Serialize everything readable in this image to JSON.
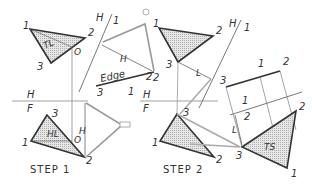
{
  "figure": {
    "step1": {
      "caption": "STEP 1",
      "top_view": {
        "vertices": [
          "1",
          "2",
          "3"
        ],
        "line_label": "TL",
        "point": "O"
      },
      "front_view": {
        "vertices": [
          "1",
          "2",
          "3"
        ],
        "line_label": "HL",
        "point": "O"
      },
      "fold_line": {
        "upper": "H",
        "lower": "F"
      },
      "aux_fold": {
        "left": "H",
        "right": "1"
      },
      "dimension": "H",
      "edge_view": {
        "label": "Edge",
        "points": [
          "3",
          "1",
          "2"
        ]
      }
    },
    "step2": {
      "caption": "STEP 2",
      "top_view": {
        "vertices": [
          "1",
          "2",
          "3"
        ]
      },
      "front_view": {
        "vertices": [
          "1",
          "2",
          "3"
        ]
      },
      "fold_line": {
        "upper": "H",
        "lower": "F"
      },
      "aux_fold": {
        "left": "H",
        "right": "1"
      },
      "dimension": "L",
      "edge_view": {
        "points": [
          "3",
          "1",
          "2"
        ]
      },
      "aux_fold2": {
        "upper": "1",
        "lower": "2"
      },
      "true_shape": {
        "label": "TS",
        "vertices": [
          "3",
          "2",
          "1"
        ]
      }
    }
  },
  "colors": {
    "line": "#333333",
    "shade": "#c8c8c8",
    "light": "#888888"
  }
}
